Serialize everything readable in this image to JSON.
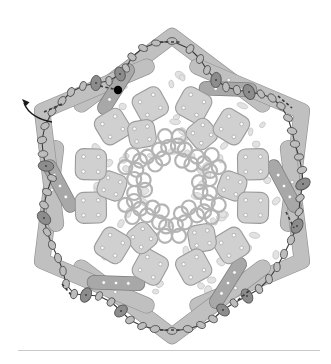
{
  "figure": {
    "canvas": {
      "width": 331,
      "height": 364
    },
    "center": {
      "x": 172,
      "y": 186
    },
    "symmetry_fold": 6,
    "caption_rule": {
      "x": 18,
      "y": 350,
      "width": 302,
      "color": "#c9c9c9"
    }
  },
  "palette": {
    "background": "#ffffff",
    "tile_light": "#d0d0d0",
    "tile_light_stroke": "#9a9a9a",
    "chevron": "#c0c0c0",
    "chevron_stroke": "#949494",
    "bar_dark": "#a8a8a8",
    "bar_dark_stroke": "#7d7d7d",
    "ring_stroke": "#b4b4b4",
    "speckle": "#e2e2e2",
    "speckle_stroke": "#c2c2c2",
    "bead_light": "#bdbdbd",
    "bead_dark": "#8c8c8c",
    "bead_stroke": "#555555",
    "chain_stroke": "#3a3a3a",
    "dot_white": "#ffffff",
    "marker_black": "#000000",
    "arrow": "#1a1a1a"
  },
  "annotations": {
    "start_marker": {
      "name": "start-point",
      "x": 118,
      "y": 90,
      "r": 4.2,
      "color": "#000000"
    },
    "entry_arrow": {
      "name": "entry-arrow",
      "path": "M 52 122 C 40 120 28 114 24 103",
      "tip": {
        "x": 22,
        "y": 99
      },
      "color": "#1a1a1a"
    },
    "dashed_segments": [
      {
        "x1": 100,
        "y1": 86,
        "x2": 118,
        "y2": 90
      },
      {
        "x1": 160,
        "y1": 42,
        "x2": 182,
        "y2": 42
      },
      {
        "x1": 44,
        "y1": 112,
        "x2": 62,
        "y2": 104
      },
      {
        "x1": 278,
        "y1": 96,
        "x2": 292,
        "y2": 108
      },
      {
        "x1": 286,
        "y1": 212,
        "x2": 294,
        "y2": 228
      },
      {
        "x1": 238,
        "y1": 300,
        "x2": 250,
        "y2": 290
      },
      {
        "x1": 160,
        "y1": 330,
        "x2": 180,
        "y2": 330
      },
      {
        "x1": 62,
        "y1": 284,
        "x2": 72,
        "y2": 296
      }
    ]
  },
  "perimeter_chain": {
    "name": "bead-chain",
    "closed": true,
    "beads": [
      {
        "x": 172,
        "y": 41,
        "rx": 5.0,
        "ry": 3.4,
        "rot": 0,
        "tone": "light"
      },
      {
        "x": 156,
        "y": 43,
        "rx": 4.4,
        "ry": 3.0,
        "rot": 10,
        "tone": "light"
      },
      {
        "x": 143,
        "y": 48,
        "rx": 4.6,
        "ry": 3.2,
        "rot": 25,
        "tone": "light"
      },
      {
        "x": 132,
        "y": 57,
        "rx": 4.6,
        "ry": 3.4,
        "rot": 40,
        "tone": "light"
      },
      {
        "x": 126,
        "y": 68,
        "rx": 4.4,
        "ry": 3.2,
        "rot": 60,
        "tone": "light"
      },
      {
        "x": 120,
        "y": 74,
        "rx": 7.2,
        "ry": 5.0,
        "rot": 70,
        "tone": "dark"
      },
      {
        "x": 109,
        "y": 81,
        "rx": 4.6,
        "ry": 3.2,
        "rot": 80,
        "tone": "light"
      },
      {
        "x": 96,
        "y": 83,
        "rx": 7.6,
        "ry": 5.2,
        "rot": 95,
        "tone": "dark"
      },
      {
        "x": 83,
        "y": 86,
        "rx": 4.6,
        "ry": 3.2,
        "rot": 105,
        "tone": "light"
      },
      {
        "x": 71,
        "y": 92,
        "rx": 4.6,
        "ry": 3.4,
        "rot": 115,
        "tone": "light"
      },
      {
        "x": 62,
        "y": 101,
        "rx": 5.0,
        "ry": 3.4,
        "rot": 125,
        "tone": "light"
      },
      {
        "x": 52,
        "y": 112,
        "rx": 4.6,
        "ry": 3.2,
        "rot": 135,
        "tone": "light"
      },
      {
        "x": 45,
        "y": 126,
        "rx": 4.4,
        "ry": 3.2,
        "rot": 150,
        "tone": "light"
      },
      {
        "x": 42,
        "y": 140,
        "rx": 4.6,
        "ry": 3.4,
        "rot": 165,
        "tone": "light"
      },
      {
        "x": 43,
        "y": 154,
        "rx": 4.8,
        "ry": 3.4,
        "rot": 175,
        "tone": "light"
      },
      {
        "x": 46,
        "y": 166,
        "rx": 7.8,
        "ry": 5.2,
        "rot": 5,
        "tone": "dark"
      },
      {
        "x": 52,
        "y": 178,
        "rx": 4.6,
        "ry": 3.2,
        "rot": 15,
        "tone": "light"
      },
      {
        "x": 47,
        "y": 192,
        "rx": 4.6,
        "ry": 3.4,
        "rot": 25,
        "tone": "light"
      },
      {
        "x": 44,
        "y": 205,
        "rx": 4.8,
        "ry": 3.4,
        "rot": 35,
        "tone": "light"
      },
      {
        "x": 44,
        "y": 218,
        "rx": 7.8,
        "ry": 5.4,
        "rot": 45,
        "tone": "dark"
      },
      {
        "x": 47,
        "y": 232,
        "rx": 4.6,
        "ry": 3.2,
        "rot": 55,
        "tone": "light"
      },
      {
        "x": 52,
        "y": 245,
        "rx": 4.6,
        "ry": 3.4,
        "rot": 65,
        "tone": "light"
      },
      {
        "x": 58,
        "y": 258,
        "rx": 4.8,
        "ry": 3.4,
        "rot": 75,
        "tone": "light"
      },
      {
        "x": 63,
        "y": 271,
        "rx": 4.6,
        "ry": 3.2,
        "rot": 85,
        "tone": "light"
      },
      {
        "x": 66,
        "y": 284,
        "rx": 4.6,
        "ry": 3.4,
        "rot": 95,
        "tone": "light"
      },
      {
        "x": 74,
        "y": 294,
        "rx": 4.8,
        "ry": 3.4,
        "rot": 105,
        "tone": "light"
      },
      {
        "x": 86,
        "y": 295,
        "rx": 7.6,
        "ry": 5.2,
        "rot": 115,
        "tone": "dark"
      },
      {
        "x": 99,
        "y": 296,
        "rx": 4.6,
        "ry": 3.2,
        "rot": 120,
        "tone": "light"
      },
      {
        "x": 111,
        "y": 302,
        "rx": 4.6,
        "ry": 3.4,
        "rot": 130,
        "tone": "light"
      },
      {
        "x": 121,
        "y": 311,
        "rx": 7.2,
        "ry": 5.0,
        "rot": 140,
        "tone": "dark"
      },
      {
        "x": 130,
        "y": 320,
        "rx": 4.6,
        "ry": 3.4,
        "rot": 150,
        "tone": "light"
      },
      {
        "x": 142,
        "y": 326,
        "rx": 4.6,
        "ry": 3.2,
        "rot": 160,
        "tone": "light"
      },
      {
        "x": 155,
        "y": 329,
        "rx": 4.8,
        "ry": 3.4,
        "rot": 170,
        "tone": "light"
      },
      {
        "x": 172,
        "y": 331,
        "rx": 5.0,
        "ry": 3.4,
        "rot": 0,
        "tone": "light"
      },
      {
        "x": 188,
        "y": 329,
        "rx": 4.8,
        "ry": 3.4,
        "rot": 10,
        "tone": "light"
      },
      {
        "x": 201,
        "y": 325,
        "rx": 4.6,
        "ry": 3.2,
        "rot": 20,
        "tone": "light"
      },
      {
        "x": 213,
        "y": 319,
        "rx": 4.6,
        "ry": 3.4,
        "rot": 30,
        "tone": "light"
      },
      {
        "x": 223,
        "y": 310,
        "rx": 7.2,
        "ry": 5.0,
        "rot": 40,
        "tone": "dark"
      },
      {
        "x": 234,
        "y": 303,
        "rx": 4.6,
        "ry": 3.2,
        "rot": 50,
        "tone": "light"
      },
      {
        "x": 247,
        "y": 296,
        "rx": 7.6,
        "ry": 5.2,
        "rot": 60,
        "tone": "dark"
      },
      {
        "x": 259,
        "y": 289,
        "rx": 4.6,
        "ry": 3.4,
        "rot": 70,
        "tone": "light"
      },
      {
        "x": 269,
        "y": 279,
        "rx": 4.8,
        "ry": 3.4,
        "rot": 80,
        "tone": "light"
      },
      {
        "x": 277,
        "y": 267,
        "rx": 4.6,
        "ry": 3.2,
        "rot": 90,
        "tone": "light"
      },
      {
        "x": 284,
        "y": 254,
        "rx": 4.6,
        "ry": 3.4,
        "rot": 100,
        "tone": "light"
      },
      {
        "x": 291,
        "y": 240,
        "rx": 4.8,
        "ry": 3.4,
        "rot": 110,
        "tone": "light"
      },
      {
        "x": 297,
        "y": 226,
        "rx": 7.8,
        "ry": 5.4,
        "rot": 120,
        "tone": "dark"
      },
      {
        "x": 299,
        "y": 212,
        "rx": 4.6,
        "ry": 3.2,
        "rot": 130,
        "tone": "light"
      },
      {
        "x": 300,
        "y": 198,
        "rx": 4.6,
        "ry": 3.4,
        "rot": 140,
        "tone": "light"
      },
      {
        "x": 303,
        "y": 184,
        "rx": 7.8,
        "ry": 5.2,
        "rot": 150,
        "tone": "dark"
      },
      {
        "x": 302,
        "y": 170,
        "rx": 4.8,
        "ry": 3.4,
        "rot": 160,
        "tone": "light"
      },
      {
        "x": 299,
        "y": 157,
        "rx": 4.6,
        "ry": 3.2,
        "rot": 170,
        "tone": "light"
      },
      {
        "x": 295,
        "y": 144,
        "rx": 4.6,
        "ry": 3.4,
        "rot": 5,
        "tone": "light"
      },
      {
        "x": 292,
        "y": 131,
        "rx": 4.8,
        "ry": 3.4,
        "rot": 15,
        "tone": "light"
      },
      {
        "x": 288,
        "y": 118,
        "rx": 4.6,
        "ry": 3.2,
        "rot": 25,
        "tone": "light"
      },
      {
        "x": 281,
        "y": 106,
        "rx": 4.6,
        "ry": 3.4,
        "rot": 35,
        "tone": "light"
      },
      {
        "x": 272,
        "y": 98,
        "rx": 4.8,
        "ry": 3.4,
        "rot": 45,
        "tone": "light"
      },
      {
        "x": 261,
        "y": 94,
        "rx": 4.6,
        "ry": 3.2,
        "rot": 55,
        "tone": "light"
      },
      {
        "x": 249,
        "y": 92,
        "rx": 7.8,
        "ry": 5.4,
        "rot": 65,
        "tone": "dark"
      },
      {
        "x": 237,
        "y": 90,
        "rx": 4.6,
        "ry": 3.4,
        "rot": 75,
        "tone": "light"
      },
      {
        "x": 226,
        "y": 87,
        "rx": 4.8,
        "ry": 3.4,
        "rot": 85,
        "tone": "light"
      },
      {
        "x": 216,
        "y": 80,
        "rx": 7.6,
        "ry": 5.2,
        "rot": 95,
        "tone": "dark"
      },
      {
        "x": 207,
        "y": 70,
        "rx": 4.6,
        "ry": 3.2,
        "rot": 105,
        "tone": "light"
      },
      {
        "x": 200,
        "y": 59,
        "rx": 4.6,
        "ry": 3.4,
        "rot": 115,
        "tone": "light"
      },
      {
        "x": 190,
        "y": 49,
        "rx": 4.8,
        "ry": 3.4,
        "rot": 125,
        "tone": "light"
      }
    ]
  },
  "petals": {
    "count": 6,
    "angles_deg": [
      0,
      60,
      120,
      180,
      240,
      300
    ],
    "chevron": {
      "name": "chevron-wedge",
      "radius": 128,
      "arm_length": 40,
      "thickness": 15,
      "half_angle_deg": 48,
      "dots": 2
    },
    "bar": {
      "name": "dark-bar",
      "radius": 112,
      "offset_deg": 30,
      "length": 44,
      "thickness": 13,
      "dots": 3
    },
    "tiles_outer": {
      "name": "dice-tile-outer",
      "radius": 84,
      "size": 31,
      "corner_radius": 8,
      "dots": 4,
      "pair_offset_deg": 15
    },
    "tiles_inner": {
      "name": "dice-tile-inner",
      "radius": 60,
      "size": 27,
      "corner_radius": 8,
      "dots": 4,
      "offset_deg": 30
    },
    "ring_cluster": {
      "name": "ring-quad-cluster",
      "radius": 46,
      "ring_radius": 7.0,
      "spread": 7.0,
      "count_per_cluster": 4
    },
    "ring_inner": {
      "name": "ring-inner-cluster",
      "radius": 34,
      "ring_radius": 7.0,
      "spread": 7.0
    }
  },
  "speckles": {
    "name": "speckle-field",
    "count_per_sector": 14,
    "rx": 4.0,
    "ry": 2.7
  }
}
